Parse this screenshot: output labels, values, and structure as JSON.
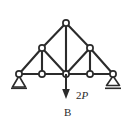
{
  "figure": {
    "kind": "truss-free-body-diagram",
    "background_color": "#ffffff",
    "line_color": "#2b2b2b",
    "joint_fill_color": "#ffffff"
  },
  "labels": {
    "load_magnitude": "2",
    "load_symbol": "P",
    "load_full": "2P",
    "point_b": "B"
  },
  "structure": {
    "joints": [
      {
        "id": "apex",
        "name": "apex-joint",
        "x": 66,
        "y": 23
      },
      {
        "id": "upper_left",
        "name": "upper-left-joint",
        "x": 42,
        "y": 48
      },
      {
        "id": "upper_right",
        "name": "upper-right-joint",
        "x": 90,
        "y": 48
      },
      {
        "id": "left_sup",
        "name": "left-support-joint",
        "x": 19,
        "y": 74
      },
      {
        "id": "bot_left",
        "name": "bottom-left-joint",
        "x": 42,
        "y": 74
      },
      {
        "id": "bot_center",
        "name": "bottom-center-joint-b",
        "x": 66,
        "y": 74
      },
      {
        "id": "bot_right",
        "name": "bottom-right-joint",
        "x": 90,
        "y": 74
      },
      {
        "id": "right_sup",
        "name": "right-support-joint",
        "x": 113,
        "y": 74
      }
    ],
    "joint_radius": 3.1,
    "members": [
      {
        "name": "top-chord-left-upper",
        "x1": 66,
        "y1": 23,
        "x2": 42,
        "y2": 48
      },
      {
        "name": "top-chord-left-lower",
        "x1": 42,
        "y1": 48,
        "x2": 19,
        "y2": 74
      },
      {
        "name": "top-chord-right-upper",
        "x1": 66,
        "y1": 23,
        "x2": 90,
        "y2": 48
      },
      {
        "name": "top-chord-right-lower",
        "x1": 90,
        "y1": 48,
        "x2": 113,
        "y2": 74
      },
      {
        "name": "center-vertical",
        "x1": 66,
        "y1": 23,
        "x2": 66,
        "y2": 74
      },
      {
        "name": "left-vertical",
        "x1": 42,
        "y1": 48,
        "x2": 42,
        "y2": 74
      },
      {
        "name": "right-vertical",
        "x1": 90,
        "y1": 48,
        "x2": 90,
        "y2": 74
      },
      {
        "name": "left-diagonal",
        "x1": 42,
        "y1": 48,
        "x2": 66,
        "y2": 74
      },
      {
        "name": "right-diagonal",
        "x1": 90,
        "y1": 48,
        "x2": 66,
        "y2": 74
      },
      {
        "name": "bottom-chord-1",
        "x1": 19,
        "y1": 74,
        "x2": 42,
        "y2": 74
      },
      {
        "name": "bottom-chord-2",
        "x1": 42,
        "y1": 74,
        "x2": 66,
        "y2": 74
      },
      {
        "name": "bottom-chord-3",
        "x1": 66,
        "y1": 74,
        "x2": 90,
        "y2": 74
      },
      {
        "name": "bottom-chord-4",
        "x1": 90,
        "y1": 74,
        "x2": 113,
        "y2": 74
      }
    ],
    "supports": [
      {
        "name": "left-pin-support",
        "type": "pin",
        "x": 19,
        "y": 74
      },
      {
        "name": "right-roller-support",
        "type": "roller",
        "x": 113,
        "y": 74
      }
    ],
    "loads": [
      {
        "name": "applied-load-2p",
        "at_joint": "bot_center",
        "direction": "down",
        "x": 66,
        "y_start": 74,
        "y_end": 98,
        "label": "2P"
      }
    ]
  }
}
